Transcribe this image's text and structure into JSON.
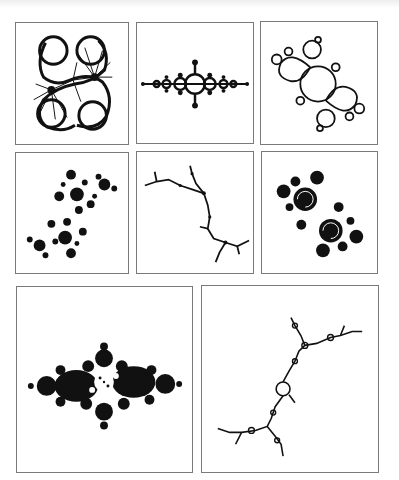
{
  "figure": {
    "type": "julia-set-gallery",
    "ink_color": "#111111",
    "border_color": "#7a7a7a",
    "background": "#ffffff",
    "panels": [
      {
        "id": 1,
        "shape": "connected-dendritic-fans",
        "rect": [
          15,
          22,
          114,
          123
        ]
      },
      {
        "id": 2,
        "shape": "horizontal-bubble-chain",
        "rect": [
          136,
          22,
          118,
          122
        ]
      },
      {
        "id": 3,
        "shape": "douady-rabbit-like-spiral",
        "rect": [
          260,
          21,
          118,
          124
        ]
      },
      {
        "id": 4,
        "shape": "disconnected-dust-clusters",
        "rect": [
          15,
          152,
          114,
          122
        ]
      },
      {
        "id": 5,
        "shape": "dendrite-zigzag",
        "rect": [
          136,
          151,
          118,
          123
        ]
      },
      {
        "id": 6,
        "shape": "double-spiral-filled",
        "rect": [
          261,
          151,
          117,
          123
        ]
      },
      {
        "id": 7,
        "shape": "dense-spiral-filled",
        "rect": [
          16,
          286,
          177,
          187
        ]
      },
      {
        "id": 8,
        "shape": "dendrite-three-armed",
        "rect": [
          201,
          285,
          178,
          188
        ]
      }
    ]
  }
}
